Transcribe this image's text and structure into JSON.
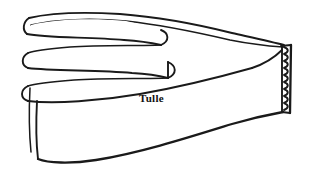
{
  "figure": {
    "label": "Tulle",
    "background_color": "#ffffff",
    "ink_color": "#1a1a1a",
    "label_color": "#111111",
    "canvas": {
      "width": 309,
      "height": 173
    },
    "label_position": {
      "x": 139,
      "y": 93
    },
    "parts": {
      "accordion_folds": "accordion-folded tulle at left",
      "main_band": "wide tulle band sweeping right",
      "gathered_end": "gathered zigzag-stitched right end"
    },
    "fold_count": 3,
    "zigzag": {
      "teeth": 13,
      "top_y": 45,
      "bottom_y": 113,
      "left_x": 283,
      "right_x": 291
    }
  }
}
